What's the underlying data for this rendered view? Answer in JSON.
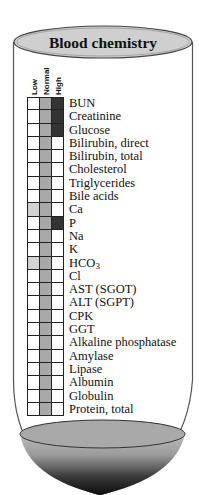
{
  "title": "Blood chemistry",
  "columns": [
    "Low",
    "Normal",
    "High"
  ],
  "colors": {
    "low": "#d2d2d2",
    "normal": "#a8a8a8",
    "high": "#333333",
    "empty": "#ffffff"
  },
  "rows": [
    {
      "label": "BUN",
      "low": false,
      "normal": true,
      "high": true
    },
    {
      "label": "Creatinine",
      "low": false,
      "normal": true,
      "high": true
    },
    {
      "label": "Glucose",
      "low": false,
      "normal": true,
      "high": true
    },
    {
      "label": "Bilirubin, direct",
      "low": false,
      "normal": true,
      "high": false
    },
    {
      "label": "Bilirubin, total",
      "low": false,
      "normal": true,
      "high": false
    },
    {
      "label": "Cholesterol",
      "low": false,
      "normal": true,
      "high": false
    },
    {
      "label": "Triglycerides",
      "low": false,
      "normal": true,
      "high": false
    },
    {
      "label": "Bile acids",
      "low": false,
      "normal": true,
      "high": false
    },
    {
      "label": "Ca",
      "low": true,
      "normal": true,
      "high": false
    },
    {
      "label": "P",
      "low": false,
      "normal": true,
      "high": true
    },
    {
      "label": "Na",
      "low": false,
      "normal": true,
      "high": false
    },
    {
      "label": "K",
      "low": false,
      "normal": true,
      "high": false
    },
    {
      "label": "HCO3",
      "low": true,
      "normal": true,
      "high": false
    },
    {
      "label": "Cl",
      "low": false,
      "normal": true,
      "high": false
    },
    {
      "label": "AST (SGOT)",
      "low": false,
      "normal": true,
      "high": false
    },
    {
      "label": "ALT (SGPT)",
      "low": false,
      "normal": true,
      "high": false
    },
    {
      "label": "CPK",
      "low": false,
      "normal": true,
      "high": false
    },
    {
      "label": "GGT",
      "low": false,
      "normal": true,
      "high": false
    },
    {
      "label": "Alkaline phosphatase",
      "low": false,
      "normal": true,
      "high": false
    },
    {
      "label": "Amylase",
      "low": false,
      "normal": true,
      "high": false
    },
    {
      "label": "Lipase",
      "low": false,
      "normal": true,
      "high": false
    },
    {
      "label": "Albumin",
      "low": false,
      "normal": true,
      "high": false
    },
    {
      "label": "Globulin",
      "low": false,
      "normal": true,
      "high": false
    },
    {
      "label": "Protein, total",
      "low": false,
      "normal": true,
      "high": false
    }
  ]
}
